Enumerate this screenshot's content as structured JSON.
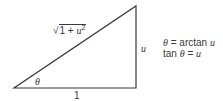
{
  "diagram": {
    "type": "right-triangle",
    "hypotenuse_label": {
      "radicand_prefix": "1 + ",
      "var": "u",
      "exp": "2",
      "symbol": "√"
    },
    "opposite_label": "u",
    "adjacent_label": "1",
    "angle_label": "θ",
    "equations": [
      {
        "lhs": "θ",
        "op": " = ",
        "rhs_text": "arctan ",
        "rhs_var": "u"
      },
      {
        "lhs_text": "tan ",
        "lhs_var": "θ",
        "op": " = ",
        "rhs_var": "u"
      }
    ],
    "stroke_color": "#3a3a3a"
  }
}
